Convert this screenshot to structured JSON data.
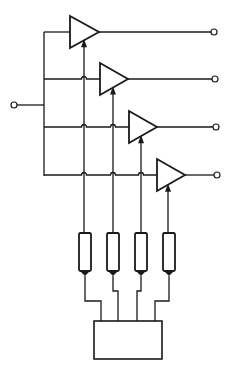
{
  "diagram": {
    "title": "",
    "type": "circuit-schematic",
    "stroke_color": "#1a1a1a",
    "background": "#ffffff",
    "input_terminal": {
      "x": 14,
      "y": 105
    },
    "bus": {
      "x": 44,
      "top": 32,
      "bottom": 176
    },
    "amplifiers": [
      {
        "id": "amp-1",
        "left": 70,
        "top": 16,
        "bottom": 48,
        "tip": 99,
        "row_y": 32,
        "control_x": 84,
        "output_x": 214
      },
      {
        "id": "amp-2",
        "left": 100,
        "top": 63,
        "bottom": 95,
        "tip": 128,
        "row_y": 79,
        "control_x": 113,
        "output_x": 215
      },
      {
        "id": "amp-3",
        "left": 129,
        "top": 111,
        "bottom": 143,
        "tip": 157,
        "row_y": 127,
        "control_x": 141,
        "output_x": 216
      },
      {
        "id": "amp-4",
        "left": 157,
        "top": 159,
        "bottom": 191,
        "tip": 185,
        "row_y": 175,
        "control_x": 168,
        "output_x": 217
      }
    ],
    "potentiometers": [
      {
        "id": "pot-1",
        "cx": 85,
        "top": 233,
        "bottom": 271,
        "lead_jog_y": 301,
        "box_x": 101
      },
      {
        "id": "pot-2",
        "cx": 113,
        "top": 233,
        "bottom": 271,
        "lead_jog_y": 291,
        "box_x": 118
      },
      {
        "id": "pot-3",
        "cx": 141,
        "top": 233,
        "bottom": 271,
        "lead_jog_y": 291,
        "box_x": 137
      },
      {
        "id": "pot-4",
        "cx": 169,
        "top": 233,
        "bottom": 271,
        "lead_jog_y": 301,
        "box_x": 155
      }
    ],
    "control_box": {
      "x": 94,
      "y": 321,
      "width": 68,
      "height": 38,
      "label": ""
    }
  }
}
